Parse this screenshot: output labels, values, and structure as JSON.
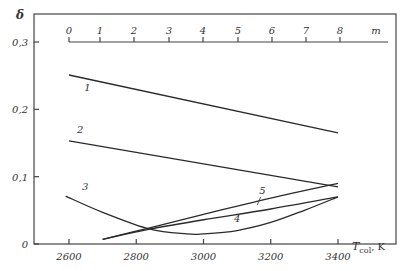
{
  "chart_data": {
    "type": "line",
    "title": "",
    "ylabel": "δ",
    "xlabel": "T_col, K",
    "xlabel_main": "T",
    "xlabel_sub": "col",
    "xlabel_unit": ", K",
    "xlim": [
      2600,
      3400
    ],
    "ylim": [
      0,
      0.3
    ],
    "grid": false,
    "x_ticks": [
      2600,
      2800,
      3000,
      3200,
      3400
    ],
    "x_tick_labels": [
      "2600",
      "2800",
      "3000",
      "3200",
      "3400"
    ],
    "y_ticks": [
      0,
      0.1,
      0.2,
      0.3
    ],
    "y_tick_labels": [
      "0",
      "0,1",
      "0,2",
      "0,3"
    ],
    "secondary_axis": {
      "label": "m",
      "position": "top, at δ = 0.3",
      "ticks": [
        0,
        1,
        2,
        3,
        4,
        5,
        6,
        7,
        8
      ],
      "tick_labels": [
        "0",
        "1",
        "2",
        "3",
        "4",
        "5",
        "6",
        "7",
        "8"
      ]
    },
    "series": [
      {
        "name": "1",
        "x": [
          2600,
          3400
        ],
        "y": [
          0.251,
          0.165
        ]
      },
      {
        "name": "2",
        "x": [
          2600,
          3400
        ],
        "y": [
          0.153,
          0.085
        ]
      },
      {
        "name": "3",
        "x": [
          2590,
          2700,
          2840,
          2950,
          3000,
          3100,
          3200,
          3300,
          3400
        ],
        "y": [
          0.071,
          0.047,
          0.022,
          0.015,
          0.015,
          0.02,
          0.032,
          0.05,
          0.07
        ]
      },
      {
        "name": "4",
        "x": [
          2700,
          2840,
          3000,
          3200,
          3400
        ],
        "y": [
          0.007,
          0.022,
          0.036,
          0.052,
          0.07
        ]
      },
      {
        "name": "5",
        "x": [
          2700,
          2840,
          3000,
          3200,
          3400
        ],
        "y": [
          0.007,
          0.024,
          0.044,
          0.068,
          0.09
        ]
      }
    ],
    "curve_labels": [
      {
        "text": "1",
        "x": 2655,
        "y": 0.227
      },
      {
        "text": "2",
        "x": 2633,
        "y": 0.165
      },
      {
        "text": "3",
        "x": 2648,
        "y": 0.08
      },
      {
        "text": "4",
        "x": 3100,
        "y": 0.032
      },
      {
        "text": "5",
        "x": 3175,
        "y": 0.075
      }
    ]
  }
}
